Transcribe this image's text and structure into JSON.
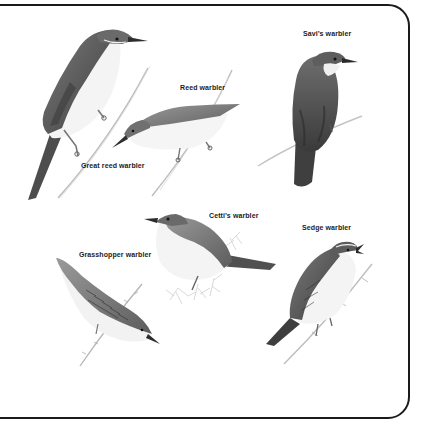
{
  "plate": {
    "title": "Warblers illustration plate",
    "frame_color": "#1a1a1a",
    "background": "#ffffff"
  },
  "birds": [
    {
      "id": "great-reed-warbler",
      "label": "Great reed warbler",
      "label_pos": [
        81,
        162
      ]
    },
    {
      "id": "reed-warbler",
      "label": "Reed warbler",
      "label_pos": [
        180,
        84
      ]
    },
    {
      "id": "savis-warbler",
      "label": "Savi’s warbler",
      "label_pos": [
        303,
        30
      ]
    },
    {
      "id": "cettis-warbler",
      "label": "Cetti’s warbler",
      "label_pos": [
        209,
        212
      ]
    },
    {
      "id": "sedge-warbler",
      "label": "Sedge warbler",
      "label_pos": [
        302,
        224
      ]
    },
    {
      "id": "grasshopper-warbler",
      "label": "Grasshopper warbler",
      "label_pos": [
        79,
        251
      ]
    }
  ],
  "colors": {
    "plumage_dark": "#5a5a5a",
    "plumage_mid": "#8a8a8a",
    "plumage_light": "#bdbdbd",
    "underparts": "#f2f2f2",
    "stem": "#b8b8b8"
  }
}
